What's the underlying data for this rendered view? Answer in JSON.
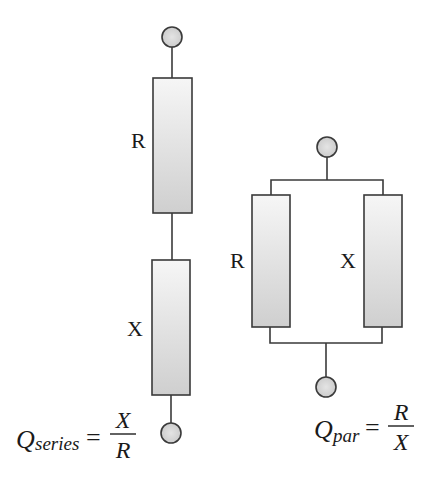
{
  "diagram": {
    "series_circuit": {
      "components": [
        {
          "id": "R",
          "label": "R"
        },
        {
          "id": "X",
          "label": "X"
        }
      ],
      "formula": {
        "symbol": "Q",
        "subscript": "series",
        "equals": "=",
        "numerator": "X",
        "denominator": "R"
      }
    },
    "parallel_circuit": {
      "components": [
        {
          "id": "R",
          "label": "R"
        },
        {
          "id": "X",
          "label": "X"
        }
      ],
      "formula": {
        "symbol": "Q",
        "subscript": "par",
        "equals": "=",
        "numerator": "R",
        "denominator": "X"
      }
    },
    "colors": {
      "stroke": "#3a3a3a",
      "fill_top": "#f6f6f6",
      "fill_bottom": "#cfcfcf",
      "text": "#1a1a1a"
    }
  }
}
